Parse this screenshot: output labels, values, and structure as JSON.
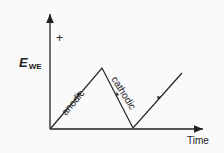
{
  "diagram": {
    "y_axis": {
      "label_main": "E",
      "label_sub": "WE",
      "sign": "+"
    },
    "x_axis": {
      "label": "Time"
    },
    "segments": [
      {
        "label": "anodic",
        "direction": "rising"
      },
      {
        "label": "cathodic",
        "direction": "falling"
      },
      {
        "label": "",
        "direction": "rising"
      }
    ],
    "colors": {
      "line": "#222222",
      "background": "#fafafa"
    }
  }
}
